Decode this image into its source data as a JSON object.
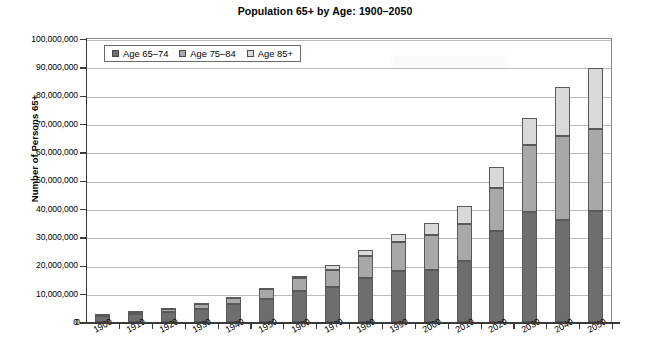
{
  "chart_data": {
    "type": "bar",
    "stacked": true,
    "title": "Population 65+ by Age: 1900–2050",
    "xlabel": "",
    "ylabel": "Number of Persons 65+",
    "ylim": [
      0,
      100000000
    ],
    "ytick_step": 10000000,
    "grid": true,
    "legend_position": "top-left-inside",
    "categories": [
      "1900",
      "1910",
      "1920",
      "1930",
      "1940",
      "1950",
      "1960",
      "1970",
      "1980",
      "1990",
      "2000",
      "2010",
      "2020",
      "2030",
      "2040",
      "2050"
    ],
    "ytick_labels": [
      "0",
      "10,000,000",
      "20,000,000",
      "30,000,000",
      "40,000,000",
      "50,000,000",
      "60,000,000",
      "70,000,000",
      "80,000,000",
      "90,000,000",
      "100,000,000"
    ],
    "series": [
      {
        "name": "Age 65–74",
        "color": "#6e6e6e",
        "values": [
          2200000,
          2800000,
          3500000,
          4900000,
          6400000,
          8400000,
          11000000,
          12500000,
          15600000,
          18100000,
          18400000,
          21700000,
          32300000,
          38800000,
          36100000,
          39400000
        ]
      },
      {
        "name": "Age 75–84",
        "color": "#a8a8a8",
        "values": [
          800000,
          1000000,
          1300000,
          1800000,
          2300000,
          3300000,
          4600000,
          6100000,
          7700000,
          10100000,
          12400000,
          13100000,
          15300000,
          23700000,
          29500000,
          29000000
        ]
      },
      {
        "name": "Age 85+",
        "color": "#d9d9d9",
        "values": [
          120000,
          200000,
          250000,
          300000,
          400000,
          600000,
          900000,
          1500000,
          2300000,
          3100000,
          4300000,
          6100000,
          7300000,
          9600000,
          17300000,
          21400000
        ]
      }
    ],
    "totals": [
      3120000,
      4000000,
      5050000,
      7000000,
      9100000,
      12300000,
      16500000,
      20100000,
      25600000,
      31300000,
      35100000,
      40900000,
      54900000,
      72100000,
      82900000,
      89800000
    ]
  }
}
